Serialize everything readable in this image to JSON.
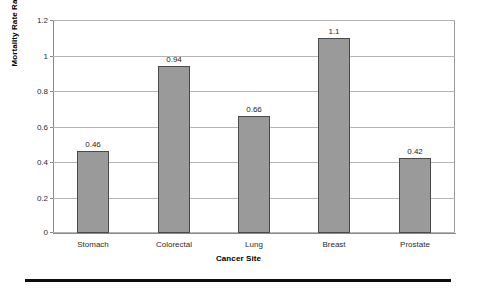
{
  "chart_data": {
    "type": "bar",
    "title": "",
    "subtitle": "",
    "xlabel": "Cancer Site",
    "ylabel": "Mortality Rate Ratio",
    "categories": [
      "Stomach",
      "Colorectal",
      "Lung",
      "Breast",
      "Prostate"
    ],
    "values": [
      0.46,
      0.94,
      0.66,
      1.1,
      0.42
    ],
    "data_labels": [
      "0.46",
      "0.94",
      "0.66",
      "1.1",
      "0.42"
    ],
    "ylim": [
      0,
      1.2
    ],
    "ytick_values": [
      0,
      0.2,
      0.4,
      0.6,
      0.8,
      1,
      1.2
    ],
    "ytick_labels": [
      "0",
      "0.2",
      "0.4",
      "0.6",
      "0.8",
      "1",
      "1.2"
    ],
    "grid": "horizontal",
    "legend": "none",
    "bar_color": "#9a9a9a",
    "bar_border_color": "#4a4a4a",
    "gridline_color": "#b5b5b5",
    "axis_color": "#8a8a8a",
    "rule_color": "#0d0d0d"
  }
}
